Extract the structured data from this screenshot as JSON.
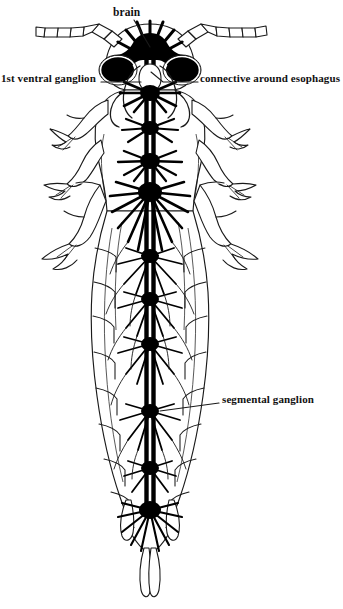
{
  "figure": {
    "view": "dorsal dissection showing central nervous system",
    "background_color": "#ffffff",
    "ink_color": "#000000",
    "outline_color": "#1a1a1a"
  },
  "labels": {
    "brain": "brain",
    "first_ventral_ganglion": "1st ventral ganglion",
    "connective_around_esophagus": "connective around esophagus",
    "segmental_ganglion": "segmental ganglion"
  },
  "anatomy": {
    "antennae_count": 2,
    "antenna_segments": 6,
    "legs_per_side": 3,
    "cerci_count": 2,
    "ganglia_count": 11,
    "ganglia_positions_y": [
      60,
      90,
      128,
      160,
      190,
      255,
      298,
      343,
      410,
      467,
      508
    ],
    "nerve_cord_x": 150,
    "optic_lobe_count": 2
  },
  "leaders": {
    "brain": "from label down-right to brain mass",
    "first_ventral_ganglion": "horizontal right to subesophageal ganglion",
    "connective_around_esophagus": "horizontal left to esophageal connective loop",
    "segmental_ganglion": "horizontal left to abdominal ganglion"
  }
}
